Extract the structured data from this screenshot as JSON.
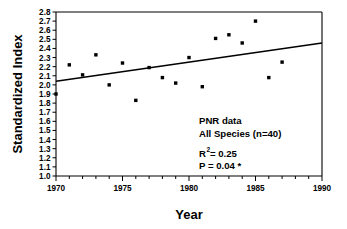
{
  "chart_data": {
    "type": "scatter",
    "title": "",
    "xlabel": "Year",
    "ylabel": "Standardized Index",
    "xlim": [
      1970,
      1990
    ],
    "ylim": [
      1.0,
      2.8
    ],
    "grid": false,
    "legend": "none",
    "x_major_ticks": [
      1970,
      1975,
      1980,
      1985,
      1990
    ],
    "x_major_tick_labels": [
      "1970",
      "1975",
      "1980",
      "1985",
      "1990"
    ],
    "x_minor_tick_step": 1,
    "y_ticks": [
      1.0,
      1.1,
      1.2,
      1.3,
      1.4,
      1.5,
      1.6,
      1.7,
      1.8,
      1.9,
      2.0,
      2.1,
      2.2,
      2.3,
      2.4,
      2.5,
      2.6,
      2.7,
      2.8
    ],
    "y_tick_labels": [
      "1.0",
      "1.1",
      "1.2",
      "1.3",
      "1.4",
      "1.5",
      "1.6",
      "1.7",
      "1.8",
      "1.9",
      "2.0",
      "2.1",
      "2.2",
      "2.3",
      "2.4",
      "2.5",
      "2.6",
      "2.7",
      "2.8"
    ],
    "marker": "square",
    "marker_color": "#000000",
    "x": [
      1970,
      1971,
      1972,
      1973,
      1974,
      1975,
      1976,
      1977,
      1978,
      1979,
      1980,
      1981,
      1982,
      1983,
      1984,
      1985,
      1986,
      1987
    ],
    "y": [
      1.9,
      2.22,
      2.11,
      2.33,
      2.0,
      2.24,
      1.83,
      2.19,
      2.08,
      2.02,
      2.3,
      1.98,
      2.51,
      2.55,
      2.46,
      2.7,
      2.08,
      2.25
    ],
    "points": [
      {
        "x": 1970,
        "y": 1.9
      },
      {
        "x": 1971,
        "y": 2.22
      },
      {
        "x": 1972,
        "y": 2.11
      },
      {
        "x": 1973,
        "y": 2.33
      },
      {
        "x": 1974,
        "y": 2.0
      },
      {
        "x": 1975,
        "y": 2.24
      },
      {
        "x": 1976,
        "y": 1.83
      },
      {
        "x": 1977,
        "y": 2.19
      },
      {
        "x": 1978,
        "y": 2.08
      },
      {
        "x": 1979,
        "y": 2.02
      },
      {
        "x": 1980,
        "y": 2.3
      },
      {
        "x": 1981,
        "y": 1.98
      },
      {
        "x": 1982,
        "y": 2.51
      },
      {
        "x": 1983,
        "y": 2.55
      },
      {
        "x": 1984,
        "y": 2.46
      },
      {
        "x": 1985,
        "y": 2.7
      },
      {
        "x": 1986,
        "y": 2.08
      },
      {
        "x": 1987,
        "y": 2.25
      }
    ],
    "trendline": {
      "type": "linear-regression",
      "color": "#000000",
      "x_start": 1970,
      "y_start": 2.04,
      "x_end": 1990,
      "y_end": 2.46
    },
    "annotations": {
      "dataset_label": "PNR data",
      "species_label": "All Species (n=40)",
      "r_squared_symbol": "R",
      "r_squared_exponent": "2",
      "r_squared_value": " = 0.25",
      "p_value": "P = 0.04 *"
    }
  }
}
